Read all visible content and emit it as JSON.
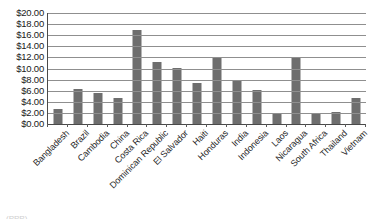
{
  "chart_data": {
    "type": "bar",
    "title": "",
    "xlabel": "",
    "ylabel": "",
    "ylim": [
      0,
      20
    ],
    "grid": true,
    "legend": "none",
    "y_tick_labels": [
      "$20.00",
      "$18.00",
      "$16.00",
      "$14.00",
      "$12.00",
      "$10.00",
      "$8.00",
      "$6.00",
      "$4.00",
      "$2.00",
      "$0.00"
    ],
    "y_tick_values": [
      20,
      18,
      16,
      14,
      12,
      10,
      8,
      6,
      4,
      2,
      0
    ],
    "categories": [
      "Bangladesh",
      "Brazil",
      "Cambodia",
      "China",
      "Costa Rica",
      "Dominican Republic",
      "El Salvador",
      "Haiti",
      "Honduras",
      "India",
      "Indonesia",
      "Laos",
      "Nicaragua",
      "South Africa",
      "Thailand",
      "Vietnam"
    ],
    "values": [
      2.7,
      6.3,
      5.6,
      4.7,
      17.0,
      11.2,
      10.1,
      7.4,
      12.1,
      7.8,
      6.1,
      2.0,
      12.0,
      1.9,
      2.2,
      4.6
    ],
    "series": [
      {
        "name": "",
        "values": [
          2.7,
          6.3,
          5.6,
          4.7,
          17.0,
          11.2,
          10.1,
          7.4,
          12.1,
          7.8,
          6.1,
          2.0,
          12.0,
          1.9,
          2.2,
          4.6
        ]
      }
    ],
    "bar_color": "#6e6e6e",
    "axis_color": "#4a4a4a",
    "grid_color": "#8f8f8f"
  },
  "caption": {
    "text": "(PPP)"
  }
}
